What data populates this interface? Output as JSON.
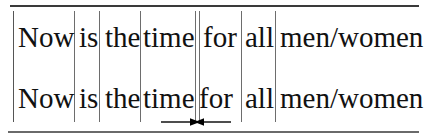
{
  "figure": {
    "kind": "segmented-text-line-diagram",
    "background_color": "#ffffff",
    "ink_color": "#111111",
    "rule_color": "#4a4a4a",
    "line_color": "#6d6d6d",
    "sentence": "Now is the time for all men/women",
    "rows": [
      {
        "id": "row-1",
        "words": [
          {
            "text": "Now",
            "x": 18
          },
          {
            "text": "is",
            "x": 79
          },
          {
            "text": "the",
            "x": 105
          },
          {
            "text": "time",
            "x": 143
          },
          {
            "text": "for",
            "x": 203
          },
          {
            "text": "all",
            "x": 245
          },
          {
            "text": "men/women",
            "x": 280
          }
        ]
      },
      {
        "id": "row-2",
        "words": [
          {
            "text": "Now",
            "x": 18
          },
          {
            "text": "is",
            "x": 79
          },
          {
            "text": "the",
            "x": 105
          },
          {
            "text": "time",
            "x": 143
          },
          {
            "text": "for",
            "x": 199
          },
          {
            "text": "all",
            "x": 245
          },
          {
            "text": "men/women",
            "x": 280
          }
        ]
      }
    ],
    "separators": [
      {
        "id": "sep-left-margin",
        "x": 13
      },
      {
        "id": "sep-after-now",
        "x": 74
      },
      {
        "id": "sep-after-is",
        "x": 99
      },
      {
        "id": "sep-after-the",
        "x": 140
      },
      {
        "id": "sep-before-for-a",
        "x": 195
      },
      {
        "id": "sep-before-for-b",
        "x": 199
      },
      {
        "id": "sep-after-for",
        "x": 241
      },
      {
        "id": "sep-after-all",
        "x": 275
      }
    ],
    "rules": {
      "top_label": "top-rule",
      "bottom_label": "bottom-rule"
    },
    "annotation": {
      "id": "gap-measure",
      "type": "double-headed-inward-arrow",
      "color": "#000000",
      "left_arrow_label": "right-pointing-arrow",
      "right_arrow_label": "left-pointing-arrow"
    }
  }
}
